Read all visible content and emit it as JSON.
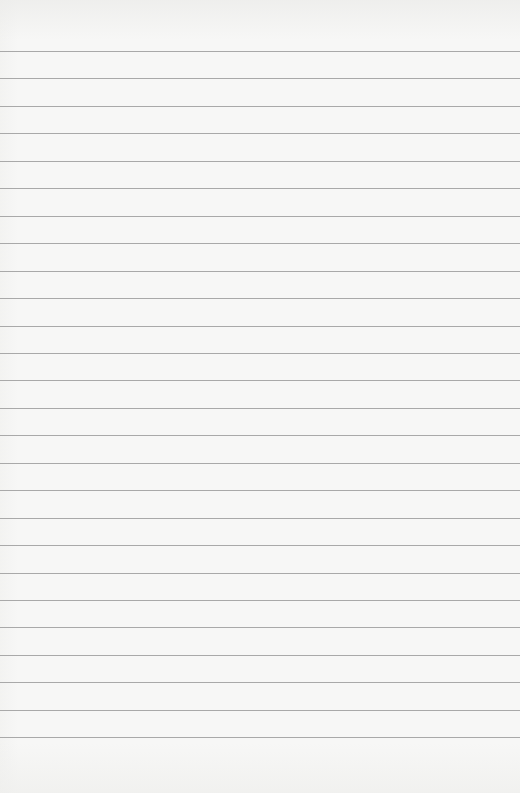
{
  "document": {
    "type": "lined-paper",
    "background_color": "#f7f7f6",
    "line_color": "#a9a9a9",
    "line_count": 26,
    "first_line_y": 51,
    "line_spacing": 27.45,
    "text": ""
  }
}
